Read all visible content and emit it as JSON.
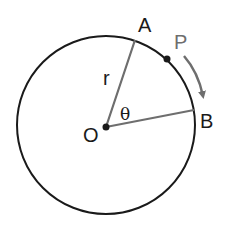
{
  "diagram": {
    "type": "circle-arc-motion",
    "labels": {
      "center": "O",
      "point_a": "A",
      "point_b": "B",
      "moving_point": "P",
      "radius": "r",
      "angle": "θ"
    },
    "colors": {
      "circle": "#1a1a1a",
      "radius_lines": "#6e6e6e",
      "arrow": "#6e6e6e",
      "label_p": "#6e6e6e",
      "points": "#1a1a1a"
    },
    "arrow_direction": "clockwise from A to B"
  }
}
